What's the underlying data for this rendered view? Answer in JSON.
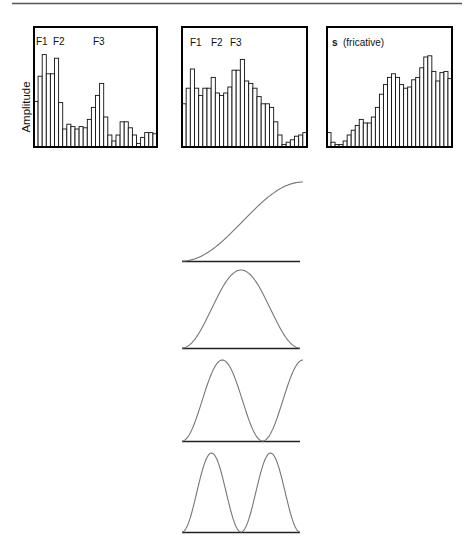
{
  "figure": {
    "y_axis_label": "Amplitude"
  },
  "chart_data": [
    {
      "type": "bar",
      "id": "spectrum-1",
      "title": "",
      "labels": [
        "F1",
        "F2",
        "F3"
      ],
      "ylabel": "Amplitude",
      "xlabel": "",
      "ylim": [
        0,
        1
      ],
      "grid": false,
      "values": [
        0.38,
        0.59,
        0.77,
        0.61,
        0.61,
        0.74,
        0.37,
        0.15,
        0.19,
        0.17,
        0.15,
        0.17,
        0.16,
        0.23,
        0.33,
        0.43,
        0.53,
        0.25,
        0.1,
        0.05,
        0.1,
        0.21,
        0.21,
        0.16,
        0.1,
        0.03,
        0.08,
        0.12,
        0.12,
        0.11
      ]
    },
    {
      "type": "bar",
      "id": "spectrum-2",
      "title": "",
      "labels": [
        "F1",
        "F2",
        "F3"
      ],
      "ylabel": "",
      "xlabel": "",
      "ylim": [
        0,
        1
      ],
      "grid": false,
      "values": [
        0.36,
        0.49,
        0.65,
        0.49,
        0.43,
        0.49,
        0.49,
        0.58,
        0.45,
        0.43,
        0.45,
        0.5,
        0.64,
        0.64,
        0.73,
        0.55,
        0.53,
        0.49,
        0.42,
        0.36,
        0.36,
        0.33,
        0.21,
        0.1,
        0.02,
        0.04,
        0.06,
        0.09,
        0.1,
        0.12
      ]
    },
    {
      "type": "bar",
      "id": "spectrum-3",
      "title": "",
      "labels": [
        "s",
        "(fricative)"
      ],
      "ylabel": "",
      "xlabel": "",
      "ylim": [
        0,
        1
      ],
      "grid": false,
      "values": [
        0.12,
        0.04,
        0.02,
        0.02,
        0.05,
        0.1,
        0.14,
        0.18,
        0.23,
        0.2,
        0.2,
        0.25,
        0.33,
        0.44,
        0.52,
        0.58,
        0.61,
        0.58,
        0.52,
        0.49,
        0.5,
        0.56,
        0.58,
        0.66,
        0.75,
        0.76,
        0.63,
        0.55,
        0.62,
        0.63,
        0.57
      ]
    },
    {
      "type": "line",
      "id": "cosine-basis",
      "title": "",
      "xlabel": "",
      "ylabel": "",
      "grid": false,
      "series": [
        {
          "name": "half-cycle",
          "function": "(1-cos(pi*0.5*2*t))/2",
          "half_cycles": 1
        },
        {
          "name": "one-cycle",
          "function": "(1-cos(2*pi*t))/2",
          "half_cycles": 2
        },
        {
          "name": "one-and-half-cycle",
          "function": "(1-cos(3*pi*t))/2",
          "half_cycles": 3
        },
        {
          "name": "two-cycle",
          "function": "(1-cos(4*pi*t))/2",
          "half_cycles": 4
        }
      ]
    }
  ]
}
